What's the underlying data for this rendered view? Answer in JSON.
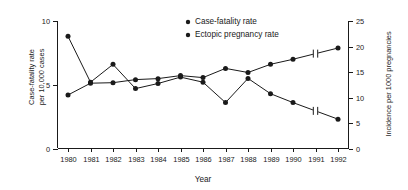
{
  "chart_data": {
    "type": "line",
    "title": "",
    "xlabel": "Year",
    "categories": [
      "1980",
      "1981",
      "1982",
      "1983",
      "1984",
      "1985",
      "1986",
      "1987",
      "1988",
      "1989",
      "1990",
      "1991",
      "1992"
    ],
    "x": [
      1980,
      1981,
      1982,
      1983,
      1984,
      1985,
      1986,
      1987,
      1988,
      1989,
      1990,
      1991,
      1992
    ],
    "xlim": [
      1979.5,
      1992.5
    ],
    "grid": false,
    "legend_position": "top-center",
    "axes": {
      "left": {
        "label_line1": "Case-fatality rate",
        "label_line2": "per 10,000 cases",
        "ticks": [
          0,
          5,
          10
        ],
        "tick_labels": [
          "0",
          "5",
          "10"
        ],
        "ylim": [
          0,
          10
        ]
      },
      "right": {
        "label": "Incidence per 1000 pregnancies",
        "ticks": [
          0,
          5,
          10,
          15,
          20,
          25
        ],
        "tick_labels": [
          "0",
          "5",
          "10",
          "15",
          "20",
          "25"
        ],
        "ylim": [
          0,
          25
        ]
      }
    },
    "series": [
      {
        "name": "Case-fatality rate",
        "axis": "left",
        "marker": "filled-circle",
        "values": [
          8.8,
          5.2,
          6.6,
          4.7,
          5.1,
          5.6,
          5.2,
          3.6,
          5.5,
          4.3,
          3.6,
          null,
          2.3
        ]
      },
      {
        "name": "Ectopic pregnancy rate",
        "axis": "right",
        "marker": "filled-circle",
        "values": [
          10.5,
          12.8,
          12.9,
          13.5,
          13.7,
          14.3,
          13.9,
          15.7,
          14.9,
          16.5,
          17.5,
          null,
          19.7
        ]
      }
    ],
    "annotations": [
      {
        "type": "axis-break",
        "between": [
          "1990",
          "1992"
        ],
        "series": "Case-fatality rate",
        "note": "line break marker"
      },
      {
        "type": "axis-break",
        "between": [
          "1990",
          "1992"
        ],
        "series": "Ectopic pregnancy rate",
        "note": "line break marker"
      }
    ],
    "legend": [
      {
        "label": "Case-fatality rate",
        "marker": "filled-circle",
        "color": "#1a1a1a"
      },
      {
        "label": "Ectopic pregnancy rate",
        "marker": "filled-circle",
        "color": "#1a1a1a"
      }
    ],
    "colors": {
      "axis": "#1a1a1a",
      "series_case_fatality": "#1a1a1a",
      "series_ectopic": "#1a1a1a",
      "background": "#ffffff"
    }
  }
}
